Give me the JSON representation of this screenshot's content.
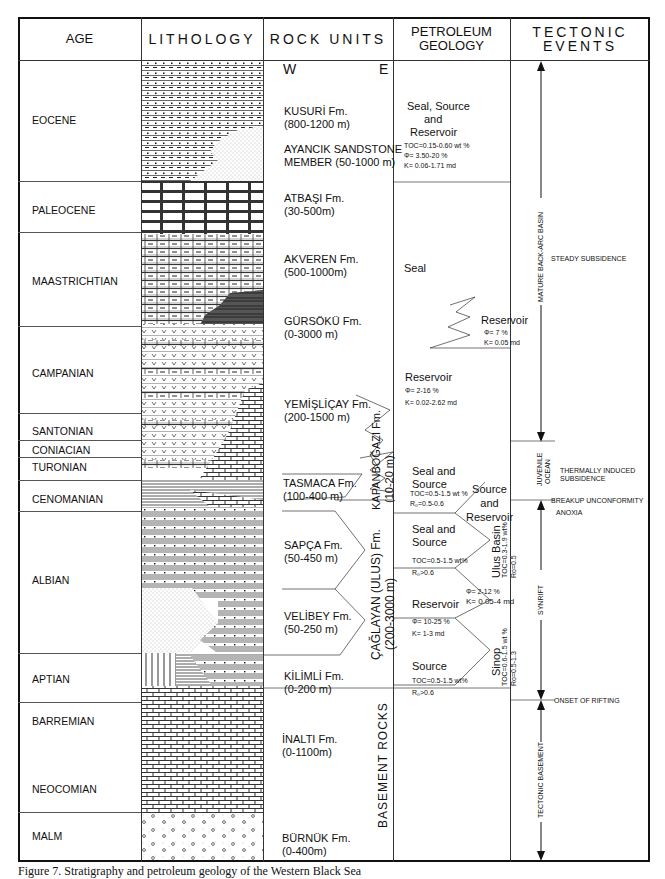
{
  "headers": {
    "age": "AGE",
    "lithology": "LITHOLOGY",
    "rock_units": "ROCK UNITS",
    "petroleum_geology": "PETROLEUM GEOLOGY",
    "tectonic_events": "TECTONIC EVENTS"
  },
  "ages": [
    {
      "label": "EOCENE"
    },
    {
      "label": "PALEOCENE"
    },
    {
      "label": "MAASTRICHTIAN"
    },
    {
      "label": "CAMPANIAN"
    },
    {
      "label": "SANTONIAN"
    },
    {
      "label": "CONIACIAN"
    },
    {
      "label": "TURONIAN"
    },
    {
      "label": "CENOMANIAN"
    },
    {
      "label": "ALBIAN"
    },
    {
      "label": "APTIAN"
    },
    {
      "label": "BARREMIAN"
    },
    {
      "label": "NEOCOMIAN"
    },
    {
      "label": "MALM"
    }
  ],
  "rock_units": {
    "west": "W",
    "east": "E",
    "formations": [
      {
        "name": "KUSURİ Fm.",
        "thickness": "(800-1200 m)"
      },
      {
        "name": "AYANCIK SANDSTONE",
        "thickness": "MEMBER (50-1000 m)"
      },
      {
        "name": "ATBAŞI Fm.",
        "thickness": "(30-500m)"
      },
      {
        "name": "AKVEREN Fm.",
        "thickness": "(500-1000m)"
      },
      {
        "name": "GÜRSÖKÜ Fm.",
        "thickness": "(0-3000 m)"
      },
      {
        "name": "YEMİŞLİÇAY Fm.",
        "thickness": "(200-1500 m)"
      },
      {
        "name": "TASMACA Fm.",
        "thickness": "(100-400 m)"
      },
      {
        "name": "SAPÇA Fm.",
        "thickness": "(50-450 m)"
      },
      {
        "name": "VELİBEY Fm.",
        "thickness": "(50-250 m)"
      },
      {
        "name": "KİLİMLİ Fm.",
        "thickness": "(0-200 m)"
      },
      {
        "name": "İNALTI Fm.",
        "thickness": "(0-1100m)"
      },
      {
        "name": "BÜRNÜK Fm.",
        "thickness": "(0-400m)"
      }
    ],
    "kapanbogazi": {
      "name": "KAPANBOĞAZI Fm.",
      "thickness": "(10-20 m)"
    },
    "caglayan": {
      "name": "ÇAĞLAYAN (ULUS) Fm.",
      "thickness": "(200-3000 m)"
    },
    "basement": "BASEMENT ROCKS"
  },
  "petroleum": {
    "eocene": {
      "title1": "Seal, Source",
      "title2": "and",
      "title3": "Reservoir",
      "toc": "TOC=0.15-0.60 wt %",
      "phi": "Φ= 3.50-20 %",
      "k": "K= 0.06-1.71 md"
    },
    "akveren_seal": "Seal",
    "gursoku": {
      "title": "Reservoir",
      "phi": "Φ= 7 %",
      "k": "K= 0.05 md"
    },
    "yemislicay": {
      "title": "Reservoir",
      "phi": "Φ= 2-16 %",
      "k": "K= 0.02-2.62 md"
    },
    "tasmaca": {
      "title1": "Seal and",
      "title2": "Source",
      "toc": "TOC=0.5-1.5 wt %",
      "ro": "R₀=0.5-0.6"
    },
    "sapca": {
      "title1": "Seal and",
      "title2": "Source",
      "toc": "TOC=0.5-1.5 wt%",
      "ro": "R₀>0.6"
    },
    "velibey": {
      "title": "Reservoir",
      "phi": "Φ= 10-25 %",
      "k": "K= 1-3 md"
    },
    "kilimli": {
      "title": "Source",
      "toc": "TOC=0.5-1.5 wt%",
      "ro": "R₀>0.6"
    },
    "caglayan_side": {
      "title1": "Source",
      "title2": "and",
      "title3": "Reservoir",
      "phi": "Φ= 2-12 %",
      "k": "K= 0.05-4 md"
    },
    "ulus_basin": {
      "name": "Ulus Basin",
      "toc": "TOC=0.3-1.9 wt%",
      "ro": "Ro=0.5"
    },
    "sinop": {
      "name": "Sinop",
      "toc": "TOC=0.6-1.5 wt %",
      "ro": "Ro=0.5-1.3"
    }
  },
  "tectonic": {
    "mature_back_arc": "MATURE BACK-ARC BASIN",
    "steady_subsidence": "STEADY SUBSIDENCE",
    "juvenile_ocean_1": "JUVENILE",
    "juvenile_ocean_2": "OCEAN",
    "thermal_1": "THERMALLY INDUCED",
    "thermal_2": "SUBSIDENCE",
    "breakup": "BREAKUP UNCONFORMITY",
    "anoxia": "ANOXIA",
    "synrift": "SYNRIFT",
    "onset": "ONSET OF RIFTING",
    "tectonic_basement": "TECTONIC BASEMENT"
  },
  "caption": "Figure 7. Stratigraphy and petroleum geology of the Western Black Sea"
}
